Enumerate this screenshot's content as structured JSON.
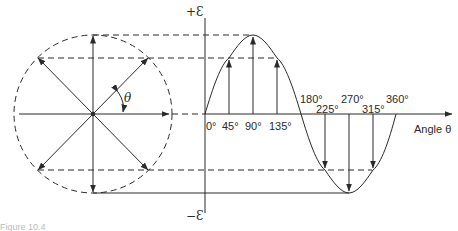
{
  "figure": {
    "type": "phasor-to-sine-wave diagram",
    "caption_partial": "Figure 10.4",
    "y_axis": {
      "top_label": "+Ɛ",
      "bottom_label": "−Ɛ"
    },
    "x_axis": {
      "label": "Angle θ"
    },
    "phasor": {
      "angle_label": "θ"
    },
    "angle_ticks": [
      {
        "deg": 0,
        "label": "0°"
      },
      {
        "deg": 45,
        "label": "45°"
      },
      {
        "deg": 90,
        "label": "90°"
      },
      {
        "deg": 135,
        "label": "135°"
      },
      {
        "deg": 180,
        "label": "180°"
      },
      {
        "deg": 225,
        "label": "225°"
      },
      {
        "deg": 270,
        "label": "270°"
      },
      {
        "deg": 315,
        "label": "315°"
      },
      {
        "deg": 360,
        "label": "360°"
      }
    ],
    "colors": {
      "ink": "#2a2a2a",
      "background": "#ffffff"
    }
  }
}
